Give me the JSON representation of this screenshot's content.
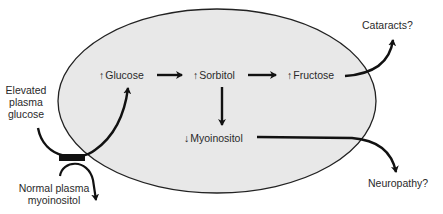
{
  "diagram": {
    "cell": {
      "fill": "#e8e8e8",
      "stroke": "#222222"
    },
    "nodes": {
      "glucose": {
        "prefix": "↑",
        "label": "Glucose"
      },
      "sorbitol": {
        "prefix": "↑",
        "label": "Sorbitol"
      },
      "fructose": {
        "prefix": "↑",
        "label": "Fructose"
      },
      "myoinositol": {
        "prefix": "↓",
        "label": "Myoinositol"
      }
    },
    "outside_labels": {
      "elevated_line1": "Elevated",
      "elevated_line2": "plasma",
      "elevated_line3": "glucose",
      "normal_line1": "Normal plasma",
      "normal_line2": "myoinositol",
      "cataracts": "Cataracts?",
      "neuropathy": "Neuropathy?"
    },
    "edges": [
      {
        "from": "Elevated plasma glucose",
        "to": "Glucose"
      },
      {
        "from": "Glucose",
        "to": "Sorbitol"
      },
      {
        "from": "Sorbitol",
        "to": "Fructose"
      },
      {
        "from": "Sorbitol",
        "to": "Myoinositol"
      },
      {
        "from": "Fructose",
        "to": "Cataracts?"
      },
      {
        "from": "Myoinositol",
        "to": "Neuropathy?"
      },
      {
        "from": "Normal plasma myoinositol",
        "to": "transporter (blocked)"
      }
    ]
  }
}
